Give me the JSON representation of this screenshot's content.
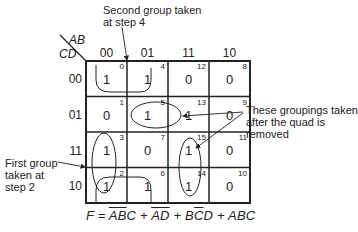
{
  "kmap": {
    "row_var": "CD",
    "col_var": "AB",
    "col_labels": [
      "00",
      "01",
      "11",
      "10"
    ],
    "row_labels": [
      "00",
      "01",
      "11",
      "10"
    ],
    "cells": [
      [
        {
          "value": "1",
          "index": "0"
        },
        {
          "value": "1",
          "index": "4"
        },
        {
          "value": "0",
          "index": "12"
        },
        {
          "value": "0",
          "index": "8"
        }
      ],
      [
        {
          "value": "0",
          "index": "1"
        },
        {
          "value": "1",
          "index": "5"
        },
        {
          "value": "1",
          "index": "13"
        },
        {
          "value": "0",
          "index": "9"
        }
      ],
      [
        {
          "value": "1",
          "index": "3"
        },
        {
          "value": "0",
          "index": "7"
        },
        {
          "value": "1",
          "index": "15"
        },
        {
          "value": "0",
          "index": "11"
        }
      ],
      [
        {
          "value": "1",
          "index": "2"
        },
        {
          "value": "1",
          "index": "6"
        },
        {
          "value": "1",
          "index": "14"
        },
        {
          "value": "0",
          "index": "10"
        }
      ]
    ]
  },
  "annotations": {
    "second_group": [
      "Second group taken",
      "at step 4"
    ],
    "later_groupings": [
      "These groupings taken",
      "after the quad is",
      "removed"
    ],
    "first_group": [
      "First group",
      "taken at",
      "step 2"
    ]
  },
  "formula": {
    "lhs": "F = ",
    "terms": [
      {
        "parts": [
          {
            "t": "A",
            "bar": true
          },
          {
            "t": "B",
            "bar": true
          },
          {
            "t": "C",
            "bar": false
          }
        ]
      },
      {
        "parts": [
          {
            "t": "A",
            "bar": true
          },
          {
            "t": "D",
            "bar": true
          }
        ]
      },
      {
        "parts": [
          {
            "t": "B",
            "bar": false
          },
          {
            "t": "C",
            "bar": true
          },
          {
            "t": "D",
            "bar": false
          }
        ]
      },
      {
        "parts": [
          {
            "t": "A",
            "bar": false
          },
          {
            "t": "B",
            "bar": false
          },
          {
            "t": "C",
            "bar": false
          }
        ]
      }
    ],
    "separator": " + "
  }
}
